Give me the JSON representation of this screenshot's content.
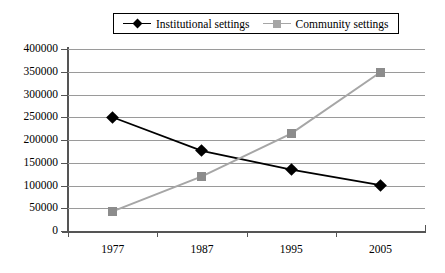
{
  "chart_data": {
    "type": "line",
    "title": "",
    "xlabel": "",
    "ylabel": "",
    "categories": [
      "1977",
      "1987",
      "1995",
      "2005"
    ],
    "ylim": [
      0,
      400000
    ],
    "ytick_step": 50000,
    "yticks": [
      "0",
      "50000",
      "100000",
      "150000",
      "200000",
      "250000",
      "300000",
      "350000",
      "400000"
    ],
    "grid": "horizontal",
    "legend_position": "top-center",
    "series": [
      {
        "name": "Institutional settings",
        "color": "#000000",
        "marker": "diamond",
        "values": [
          250000,
          176000,
          135000,
          101000
        ]
      },
      {
        "name": "Community settings",
        "color": "#a6a6a6",
        "marker": "square",
        "values": [
          43000,
          120000,
          214000,
          349000
        ]
      }
    ]
  },
  "legend": {
    "entries": [
      {
        "label": "Institutional settings",
        "marker_name": "diamond-marker-icon"
      },
      {
        "label": "Community settings",
        "marker_name": "square-marker-icon"
      }
    ]
  },
  "colors": {
    "institutional": "#000000",
    "community": "#a6a6a6",
    "gridline": "#9a9a9a",
    "axis": "#555555",
    "background": "#ffffff"
  }
}
